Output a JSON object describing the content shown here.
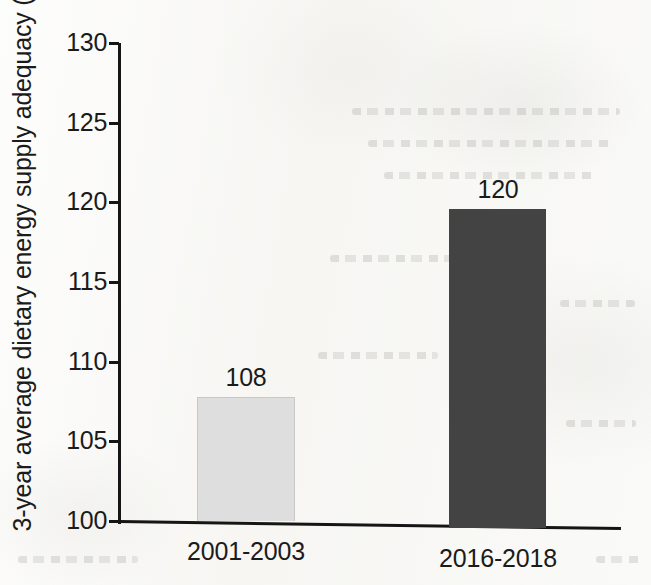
{
  "chart_data": {
    "type": "bar",
    "title": "",
    "subtitle": "",
    "xlabel": "",
    "ylabel": "3-year average dietary energy supply adequacy (%)",
    "categories": [
      "2001-2003",
      "2016-2018"
    ],
    "values": [
      108,
      120
    ],
    "bar_tops_on_axis": [
      107.8,
      119.6
    ],
    "data_labels": [
      "108",
      "120"
    ],
    "series": [
      {
        "name": "3-year average dietary energy supply adequacy",
        "values": [
          108,
          120
        ]
      }
    ],
    "ylim": [
      100,
      130
    ],
    "ytick_step": 5,
    "ytick_labels": [
      "130",
      "125",
      "120",
      "115",
      "110",
      "105",
      "100"
    ],
    "ytick_values": [
      130,
      125,
      120,
      115,
      110,
      105,
      100
    ],
    "grid": false,
    "legend": false,
    "legend_position": "none",
    "bar_colors": [
      "#dedede",
      "#434343"
    ],
    "axis_color": "#151515",
    "text_color": "#1b1b1b",
    "background_color": "#fbfbf9"
  }
}
